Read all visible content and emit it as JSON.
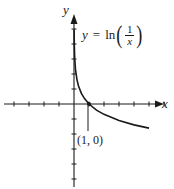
{
  "chart_data": {
    "type": "line",
    "title": "",
    "function": "y = ln(1/x)",
    "xlabel": "x",
    "ylabel": "y",
    "xlim": [
      -5,
      6
    ],
    "ylim": [
      -5,
      5
    ],
    "grid": false,
    "x_ticks": [
      -5,
      -4,
      -3,
      -2,
      -1,
      1,
      2,
      3,
      4,
      5,
      6
    ],
    "y_ticks": [
      -5,
      -4,
      -3,
      -2,
      -1,
      1,
      2,
      3,
      4,
      5
    ],
    "series": [
      {
        "name": "y = ln(1/x)",
        "x": [
          0.007,
          0.02,
          0.05,
          0.1,
          0.2,
          0.3,
          0.5,
          0.7,
          1,
          1.5,
          2,
          3,
          4,
          5
        ],
        "values": [
          4.96,
          3.91,
          3.0,
          2.3,
          1.61,
          1.2,
          0.69,
          0.36,
          0,
          -0.41,
          -0.69,
          -1.1,
          -1.39,
          -1.61
        ]
      }
    ],
    "annotations": [
      {
        "text": "(1, 0)",
        "x": 1,
        "y": 0
      },
      {
        "text": "y = ln(1/x)",
        "position": "upper right of y-axis"
      }
    ],
    "legend": null
  },
  "labels": {
    "x_axis": "x",
    "y_axis": "y",
    "equation_lhs": "y",
    "equation_eq": "=",
    "equation_fn": "ln",
    "equation_num": "1",
    "equation_den": "x",
    "point": "(1, 0)"
  },
  "colors": {
    "curve": "#1a1a1a",
    "axes": "#1a1a1a",
    "background": "#ffffff"
  }
}
